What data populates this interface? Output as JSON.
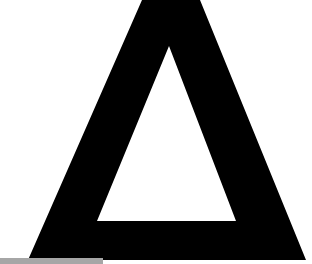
{
  "image": {
    "subject": "delta-triangle-glyph",
    "colors": {
      "background": "#ffffff",
      "glyph": "#000000",
      "bar": "#a6a6a6"
    },
    "glyph": {
      "outer": [
        [
          142,
          0
        ],
        [
          200,
          0
        ],
        [
          306,
          260
        ],
        [
          28,
          260
        ]
      ],
      "inner": [
        [
          169,
          46
        ],
        [
          97,
          221
        ],
        [
          236,
          221
        ]
      ]
    },
    "bar": {
      "x": 0,
      "y": 258,
      "width": 103,
      "height": 6
    }
  }
}
